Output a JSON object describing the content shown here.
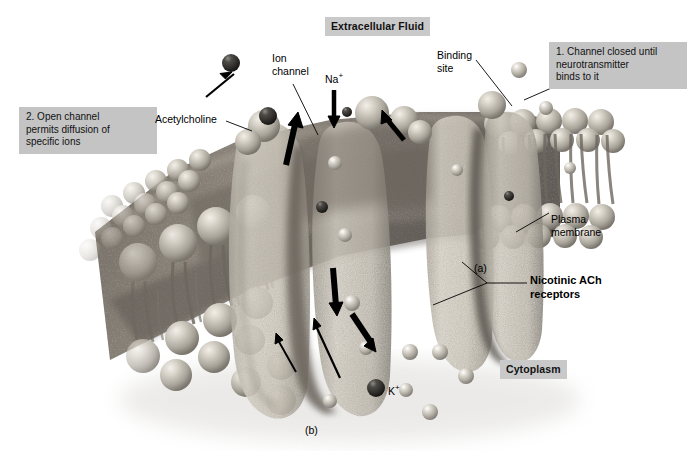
{
  "figure": {
    "title_regions": {
      "extracellular": "Extracellular Fluid",
      "cytoplasm": "Cytoplasm"
    },
    "panel_labels": {
      "a": "(a)",
      "b": "(b)"
    }
  },
  "callouts": [
    {
      "id": "step1",
      "text": "1. Channel closed until\n    neurotransmitter\n    binds to it"
    },
    {
      "id": "step2",
      "text": "2. Open channel\n    permits diffusion of\n    specific ions"
    }
  ],
  "labels": {
    "ion_channel": "Ion\nchannel",
    "sodium": "Na",
    "sodium_charge": "+",
    "potassium": "K",
    "potassium_charge": "+",
    "acetylcholine": "Acetylcholine",
    "binding_site": "Binding\nsite",
    "plasma_membrane": "Plasma\nmembrane",
    "receptors": "Nicotinic ACh\nreceptors"
  },
  "colors": {
    "label_box_bg": "#c9c9c9",
    "callout_bg": "#c4c4c4",
    "page_bg": "#ffffff",
    "membrane_dark": "#8a8279",
    "membrane_mid": "#a49c92",
    "protein_light": "#cdc8bd",
    "sphere_light": "#c8c4bb",
    "ion_dark": "#3a3a3a",
    "leader_line": "#000000"
  },
  "ions": {
    "sodium_label": "Na+",
    "potassium_label": "K+",
    "sodium_direction": "into cell (downward arrow)",
    "potassium_direction": "out of cell (upward arrow)"
  }
}
